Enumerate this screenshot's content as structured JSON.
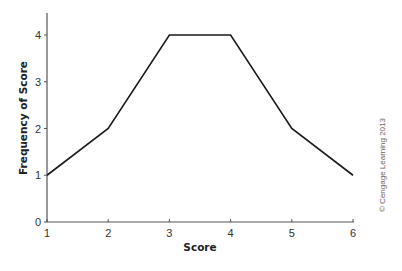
{
  "chart_data": {
    "type": "line",
    "title": "",
    "xlabel": "Score",
    "ylabel": "Frequency of Score",
    "x": [
      1,
      2,
      3,
      4,
      5,
      6
    ],
    "series": [
      {
        "name": "Frequency",
        "values": [
          1,
          2,
          4,
          4,
          2,
          1
        ]
      }
    ],
    "xticks": [
      "1",
      "2",
      "3",
      "4",
      "5",
      "6"
    ],
    "yticks": [
      "0",
      "1",
      "2",
      "3",
      "4"
    ],
    "xlim": [
      1,
      6
    ],
    "ylim": [
      0,
      4.5
    ],
    "grid": false,
    "legend": null,
    "line_color": "#1a1a1a",
    "annotation": "© Cengage Learning 2013"
  }
}
